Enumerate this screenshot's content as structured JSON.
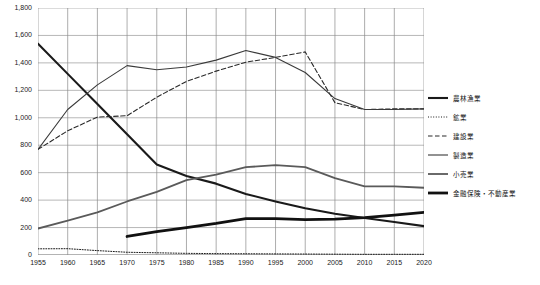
{
  "chart_data": {
    "type": "line",
    "title": "",
    "xlabel": "",
    "ylabel": "",
    "x": [
      1955,
      1960,
      1965,
      1970,
      1975,
      1980,
      1985,
      1990,
      1995,
      2000,
      2005,
      2010,
      2015,
      2020
    ],
    "xlim": [
      1955,
      2020
    ],
    "ylim": [
      0,
      1800
    ],
    "yticks": [
      0,
      200,
      400,
      600,
      800,
      1000,
      1200,
      1400,
      1600,
      1800
    ],
    "ytick_labels": [
      "0",
      "200",
      "400",
      "600",
      "800",
      "1,000",
      "1,200",
      "1,400",
      "1,600",
      "1,800"
    ],
    "xtick_labels": [
      "1955",
      "1960",
      "1965",
      "1970",
      "1975",
      "1980",
      "1985",
      "1990",
      "1995",
      "2000",
      "2005",
      "2010",
      "2015",
      "2020"
    ],
    "grid": true,
    "legend_position": "right",
    "series": [
      {
        "name": "農林漁業",
        "style": "solid-thick",
        "color": "#1a1a1a",
        "width": 2.1,
        "x": [
          1955,
          1960,
          1965,
          1970,
          1975,
          1980,
          1985,
          1990,
          1995,
          2000,
          2005,
          2010,
          2015,
          2020
        ],
        "values": [
          1540,
          1320,
          1100,
          880,
          660,
          575,
          520,
          445,
          390,
          340,
          300,
          270,
          240,
          210
        ]
      },
      {
        "name": "鉱業",
        "style": "dotted",
        "color": "#1a1a1a",
        "width": 1,
        "x": [
          1955,
          1960,
          1965,
          1970,
          1975,
          1980,
          1985,
          1990,
          1995,
          2000,
          2005,
          2010,
          2015,
          2020
        ],
        "values": [
          45,
          46,
          32,
          20,
          16,
          12,
          10,
          9,
          8,
          7,
          6,
          5,
          5,
          5
        ]
      },
      {
        "name": "建設業",
        "style": "dashed",
        "color": "#2a2a2a",
        "width": 1.1,
        "x": [
          1955,
          1960,
          1965,
          1970,
          1975,
          1980,
          1985,
          1990,
          1995,
          2000,
          2005,
          2010,
          2015,
          2020
        ],
        "values": [
          770,
          905,
          1005,
          1015,
          1150,
          1265,
          1340,
          1405,
          1440,
          1480,
          1110,
          1060,
          1065,
          1065
        ]
      },
      {
        "name": "製造業",
        "style": "solid",
        "color": "#3a3a3a",
        "width": 1.1,
        "x": [
          1955,
          1960,
          1965,
          1970,
          1975,
          1980,
          1985,
          1990,
          1995,
          2000,
          2005,
          2010,
          2015,
          2020
        ],
        "values": [
          770,
          1060,
          1240,
          1380,
          1350,
          1370,
          1420,
          1490,
          1440,
          1330,
          1140,
          1060,
          1060,
          1065
        ]
      },
      {
        "name": "小売業",
        "style": "solid-gray",
        "color": "#5a5a5a",
        "width": 1.8,
        "x": [
          1955,
          1960,
          1965,
          1970,
          1975,
          1980,
          1985,
          1990,
          1995,
          2000,
          2005,
          2010,
          2015,
          2020
        ],
        "values": [
          193,
          250,
          310,
          390,
          460,
          545,
          585,
          640,
          655,
          640,
          560,
          500,
          500,
          490
        ]
      },
      {
        "name": "金融保険・不動産業",
        "style": "solid-extrathick",
        "color": "#111111",
        "width": 2.8,
        "x": [
          1970,
          1975,
          1980,
          1985,
          1990,
          1995,
          2000,
          2005,
          2010,
          2015,
          2020
        ],
        "values": [
          135,
          170,
          200,
          230,
          265,
          265,
          258,
          262,
          272,
          290,
          310
        ]
      }
    ]
  },
  "legend": {
    "items": [
      {
        "label": "農林漁業",
        "style": "solid-thick"
      },
      {
        "label": "鉱業",
        "style": "dotted"
      },
      {
        "label": "建設業",
        "style": "dashed"
      },
      {
        "label": "製造業",
        "style": "solid"
      },
      {
        "label": "小売業",
        "style": "solid-gray"
      },
      {
        "label": "金融保険・不動産業",
        "style": "solid-extrathick"
      }
    ]
  }
}
